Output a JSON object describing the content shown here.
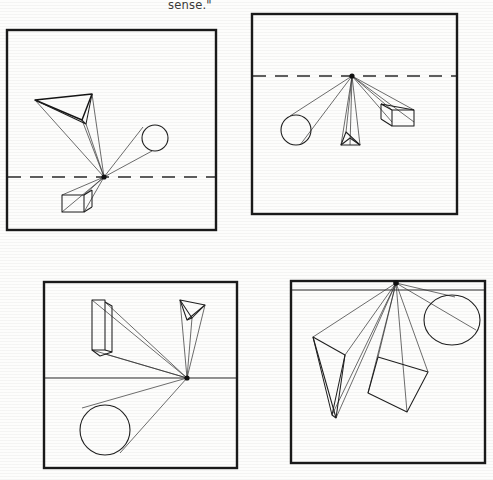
{
  "page": {
    "background_color": "#fdfdfc",
    "ink_color": "#1a1a1a",
    "width": 493,
    "height": 480,
    "caption_fragment": "sense.\""
  },
  "figure_data": {
    "type": "line-drawing",
    "description": "Four boxed one-point-perspective studies; each frame contains a horizon line, a single vanishing point on that horizon, and three geometric solids whose receding edges converge to the vanishing point.",
    "panel_count": 4,
    "panels": [
      {
        "id": "panel-1",
        "position": "top-left",
        "frame": {
          "x": 7,
          "y": 30,
          "width": 209,
          "height": 200
        },
        "horizon": {
          "style": "dashed",
          "y": 177,
          "x1": 7,
          "x2": 216
        },
        "vanishing_point": {
          "x": 104,
          "y": 177
        },
        "solids": [
          {
            "name": "wedge",
            "label": "triangular wedge",
            "location": "upper-left"
          },
          {
            "name": "cylinder",
            "label": "cylinder",
            "location": "upper-right"
          },
          {
            "name": "box",
            "label": "rectangular box",
            "location": "lower-left"
          }
        ]
      },
      {
        "id": "panel-2",
        "position": "top-right",
        "frame": {
          "x": 252,
          "y": 14,
          "width": 205,
          "height": 200
        },
        "horizon": {
          "style": "dashed",
          "y": 76,
          "x1": 252,
          "x2": 457
        },
        "vanishing_point": {
          "x": 352,
          "y": 76
        },
        "solids": [
          {
            "name": "cylinder",
            "label": "cylinder",
            "location": "lower-left"
          },
          {
            "name": "wedge",
            "label": "triangular prism",
            "location": "below-center"
          },
          {
            "name": "box",
            "label": "rectangular box",
            "location": "lower-right"
          }
        ]
      },
      {
        "id": "panel-3",
        "position": "bottom-left",
        "frame": {
          "x": 44,
          "y": 282,
          "width": 193,
          "height": 186
        },
        "horizon": {
          "style": "solid",
          "y": 378,
          "x1": 44,
          "x2": 237
        },
        "vanishing_point": {
          "x": 187,
          "y": 378
        },
        "solids": [
          {
            "name": "box",
            "label": "tall rectangular box",
            "location": "upper-left"
          },
          {
            "name": "wedge",
            "label": "triangular prism",
            "location": "upper-right"
          },
          {
            "name": "cylinder",
            "label": "cylinder",
            "location": "lower-left"
          }
        ]
      },
      {
        "id": "panel-4",
        "position": "bottom-right",
        "frame": {
          "x": 291,
          "y": 281,
          "width": 194,
          "height": 182
        },
        "horizon": {
          "style": "solid",
          "y": 290,
          "x1": 291,
          "x2": 485
        },
        "vanishing_point": {
          "x": 396,
          "y": 283
        },
        "solids": [
          {
            "name": "wedge",
            "label": "angular prism",
            "location": "left"
          },
          {
            "name": "cube",
            "label": "tilted cube",
            "location": "center"
          },
          {
            "name": "cylinder",
            "label": "ellipse / cylinder end",
            "location": "right"
          }
        ]
      }
    ]
  }
}
